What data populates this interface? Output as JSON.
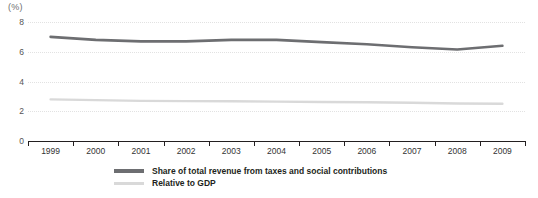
{
  "chart_data": {
    "type": "line",
    "title": "",
    "subtitle": "",
    "xlabel": "",
    "ylabel": "",
    "unit_label": "(%)",
    "categories": [
      "1999",
      "2000",
      "2001",
      "2002",
      "2003",
      "2004",
      "2005",
      "2006",
      "2007",
      "2008",
      "2009"
    ],
    "ylim": [
      0,
      8
    ],
    "yticks": [
      0,
      2,
      4,
      6,
      8
    ],
    "ytick_labels": [
      "0",
      "2",
      "4",
      "6",
      "8"
    ],
    "grid": true,
    "legend_position": "bottom-center",
    "series": [
      {
        "name": "Share of total revenue from taxes and social contributions",
        "color": "#6d6e71",
        "values": [
          7.0,
          6.8,
          6.7,
          6.7,
          6.8,
          6.8,
          6.65,
          6.5,
          6.3,
          6.15,
          6.4
        ]
      },
      {
        "name": "Relative to GDP",
        "color": "#d9d9d9",
        "values": [
          2.8,
          2.75,
          2.7,
          2.68,
          2.67,
          2.65,
          2.62,
          2.6,
          2.57,
          2.52,
          2.5
        ]
      }
    ]
  },
  "legend": {
    "items": [
      {
        "label": "Share of total revenue from taxes and social contributions",
        "swatch": "dark"
      },
      {
        "label": "Relative to GDP",
        "swatch": "light"
      }
    ]
  }
}
